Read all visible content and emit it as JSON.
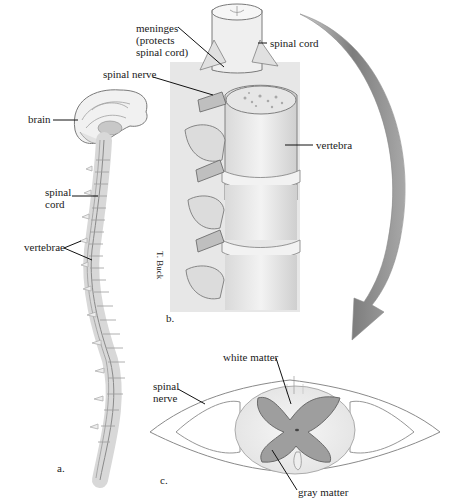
{
  "figure": {
    "panels": [
      {
        "id": "a",
        "letter": "a.",
        "subject": "human central nervous system, sagittal view",
        "labels": {
          "brain": "brain",
          "spinal_cord_line1": "spinal",
          "spinal_cord_line2": "cord",
          "vertebrae": "vertebrae"
        }
      },
      {
        "id": "b",
        "letter": "b.",
        "subject": "vertebral column close-up",
        "labels": {
          "meninges_line1": "meninges",
          "meninges_line2": "(protects",
          "meninges_line3": "spinal cord)",
          "spinal_cord": "spinal cord",
          "spinal_nerve": "spinal nerve",
          "vertebra": "vertebra"
        },
        "credit": "T. Buck"
      },
      {
        "id": "c",
        "letter": "c.",
        "subject": "spinal cord cross-section",
        "labels": {
          "white_matter": "white matter",
          "spinal_nerve_line1": "spinal",
          "spinal_nerve_line2": "nerve",
          "gray_matter": "gray matter"
        }
      }
    ],
    "colors": {
      "outline": "#6e6e6e",
      "bone_fill": "#ececec",
      "bone_shade": "#bdbdbd",
      "gray_matter": "#9a9a9a",
      "arrow": "#7a7a7a",
      "leader": "#111111"
    }
  }
}
